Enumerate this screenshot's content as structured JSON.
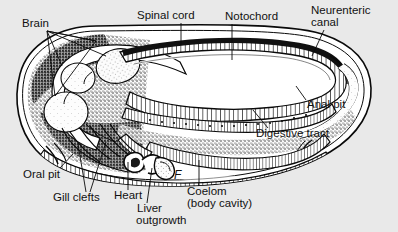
{
  "figure": {
    "background_color": "#e9e9e9",
    "ink_color": "#111111",
    "width": 398,
    "height": 232
  },
  "labels": [
    {
      "id": "brain",
      "text": "Brain",
      "x": 22,
      "y": 18,
      "italic": false
    },
    {
      "id": "spinal-cord",
      "text": "Spinal cord",
      "x": 137,
      "y": 10,
      "italic": false
    },
    {
      "id": "notochord",
      "text": "Notochord",
      "x": 225,
      "y": 11,
      "italic": false
    },
    {
      "id": "neurenteric-1",
      "text": "Neurenteric",
      "x": 311,
      "y": 5,
      "italic": false
    },
    {
      "id": "neurenteric-2",
      "text": "canal",
      "x": 311,
      "y": 17,
      "italic": false
    },
    {
      "id": "anal-pit",
      "text": "Anal pit",
      "x": 307,
      "y": 99,
      "italic": false
    },
    {
      "id": "digestive-tract",
      "text": "Digestive tract",
      "x": 256,
      "y": 128,
      "italic": false
    },
    {
      "id": "oral-pit",
      "text": "Oral pit",
      "x": 23,
      "y": 169,
      "italic": false
    },
    {
      "id": "gill-clefts",
      "text": "Gill clefts",
      "x": 53,
      "y": 192,
      "italic": false
    },
    {
      "id": "heart",
      "text": "Heart",
      "x": 114,
      "y": 190,
      "italic": false
    },
    {
      "id": "liver-1",
      "text": "Liver",
      "x": 137,
      "y": 203,
      "italic": false
    },
    {
      "id": "liver-2",
      "text": "outgrowth",
      "x": 136,
      "y": 215,
      "italic": false
    },
    {
      "id": "coelom-1",
      "text": "Coelom",
      "x": 187,
      "y": 186,
      "italic": false
    },
    {
      "id": "coelom-2",
      "text": "(body cavity)",
      "x": 187,
      "y": 198,
      "italic": false
    },
    {
      "id": "panel-letter",
      "text": "F",
      "x": 174,
      "y": 170,
      "italic": true
    }
  ],
  "structures": [
    "body-outline",
    "brain-vesicles",
    "spinal-cord",
    "notochord",
    "neurenteric-canal",
    "anal-pit",
    "digestive-tract",
    "oral-pit",
    "gill-clefts",
    "heart",
    "liver-outgrowth",
    "coelom",
    "body-wall"
  ]
}
